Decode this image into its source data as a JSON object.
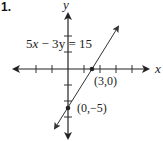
{
  "problem_number": "1.",
  "axes": {
    "x_label": "x",
    "y_label": "y"
  },
  "equation": {
    "lhs_a": "5",
    "var_x": "x",
    "op": " − 3",
    "var_y": "y",
    "rhs": " = 15"
  },
  "points": [
    {
      "label": "(3,0)",
      "x": 3,
      "y": 0
    },
    {
      "label": "(0,−5)",
      "x": 0,
      "y": -5
    }
  ],
  "line": {
    "slope": 1.6667,
    "intercept": -5,
    "equation": "5x − 3y = 15"
  },
  "colors": {
    "ink": "#222222",
    "background": "#ffffff"
  }
}
